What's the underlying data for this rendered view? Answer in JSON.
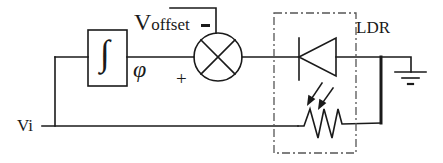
{
  "diagram": {
    "type": "circuit-schematic",
    "labels": {
      "input": "Vi",
      "offset_main": "V",
      "offset_sub": "offset",
      "offset_polarity": "–",
      "phase": "φ",
      "plus": "+",
      "ldr": "LDR",
      "integrator": "∫"
    },
    "components": [
      {
        "id": "integrator",
        "symbol": "integral-box"
      },
      {
        "id": "mixer",
        "symbol": "circle-cross"
      },
      {
        "id": "diode",
        "symbol": "diode"
      },
      {
        "id": "photoresistor",
        "symbol": "variable-resistor-with-light-arrows"
      },
      {
        "id": "ground",
        "symbol": "ground"
      },
      {
        "id": "ldr-enclosure",
        "symbol": "dash-dot-box"
      }
    ],
    "colors": {
      "stroke": "#1a1a1a",
      "background": "#ffffff",
      "dashed": "#555555"
    }
  }
}
